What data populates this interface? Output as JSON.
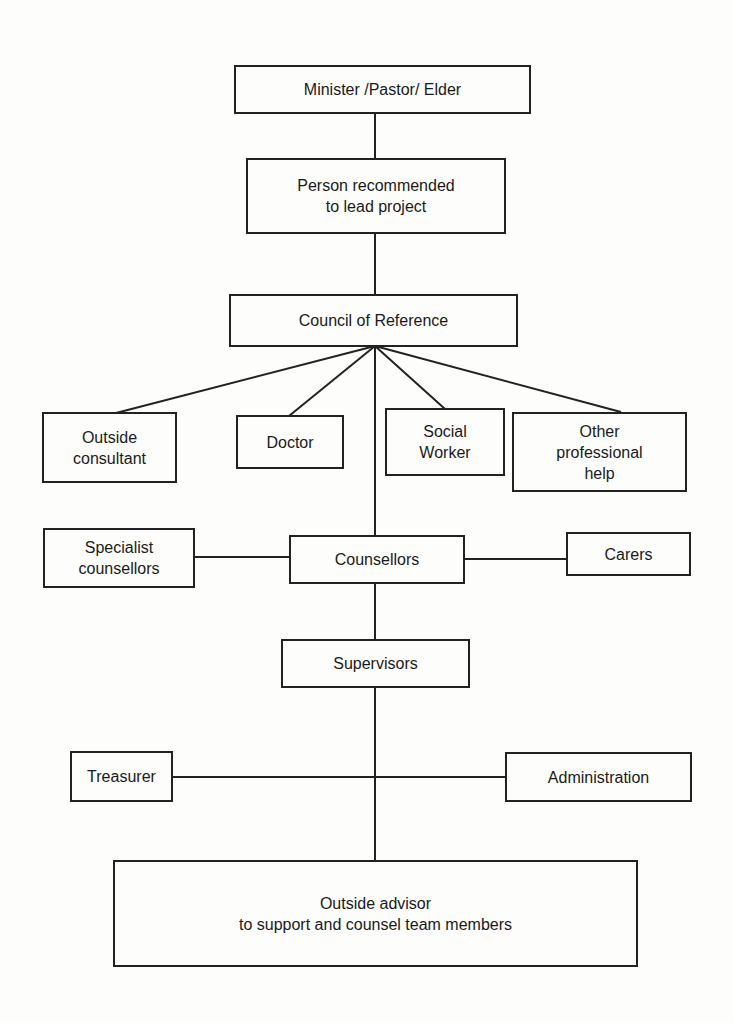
{
  "diagram": {
    "type": "organizational-chart",
    "nodes": {
      "minister": {
        "label": "Minister /Pastor/ Elder"
      },
      "lead": {
        "label": "Person recommended\nto lead project"
      },
      "council": {
        "label": "Council of Reference"
      },
      "outside_consultant": {
        "label": "Outside\nconsultant"
      },
      "doctor": {
        "label": "Doctor"
      },
      "social_worker": {
        "label": "Social\nWorker"
      },
      "other_help": {
        "label": "Other\nprofessional\nhelp"
      },
      "specialist": {
        "label": "Specialist\ncounsellors"
      },
      "counsellors": {
        "label": "Counsellors"
      },
      "carers": {
        "label": "Carers"
      },
      "supervisors": {
        "label": "Supervisors"
      },
      "treasurer": {
        "label": "Treasurer"
      },
      "administration": {
        "label": "Administration"
      },
      "outside_advisor": {
        "label": "Outside  advisor\nto support and counsel team members"
      }
    },
    "edges": [
      [
        "minister",
        "lead"
      ],
      [
        "lead",
        "council"
      ],
      [
        "council",
        "outside_consultant"
      ],
      [
        "council",
        "doctor"
      ],
      [
        "council",
        "social_worker"
      ],
      [
        "council",
        "other_help"
      ],
      [
        "council",
        "counsellors"
      ],
      [
        "specialist",
        "counsellors"
      ],
      [
        "counsellors",
        "carers"
      ],
      [
        "counsellors",
        "supervisors"
      ],
      [
        "supervisors",
        "outside_advisor"
      ],
      [
        "treasurer",
        "administration"
      ]
    ]
  }
}
